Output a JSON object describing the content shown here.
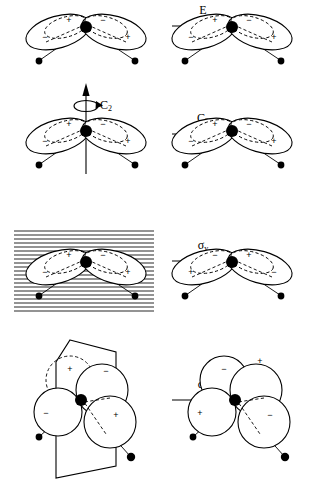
{
  "figure": {
    "ink_color": "#000000",
    "background_color": "#ffffff"
  },
  "rows": [
    {
      "id": "row-identity",
      "operation": "E",
      "operation_label": "E",
      "operation_prime": "",
      "operation_subscript": "",
      "symmetry_element": "none",
      "result": "unchanged",
      "before": {
        "view": "front",
        "lobes": [
          {
            "position": "left-upper",
            "sign": "+",
            "style": "dashed"
          },
          {
            "position": "left-lower",
            "sign": "−",
            "style": "solid"
          },
          {
            "position": "right-upper",
            "sign": "−",
            "style": "dashed"
          },
          {
            "position": "right-lower",
            "sign": "+",
            "style": "solid"
          }
        ],
        "central_atom": "filled",
        "terminal_atoms": 2
      },
      "after": {
        "view": "front",
        "lobes": [
          {
            "position": "left-upper",
            "sign": "+",
            "style": "dashed"
          },
          {
            "position": "left-lower",
            "sign": "−",
            "style": "solid"
          },
          {
            "position": "right-upper",
            "sign": "−",
            "style": "dashed"
          },
          {
            "position": "right-lower",
            "sign": "+",
            "style": "solid"
          }
        ],
        "central_atom": "filled",
        "terminal_atoms": 2
      }
    },
    {
      "id": "row-c2",
      "operation": "C2",
      "operation_label": "C",
      "operation_prime": "",
      "operation_subscript": "2",
      "symmetry_element": "vertical rotation axis with curved rotation arrow",
      "axis_label": "C",
      "axis_subscript": "2",
      "result": "unchanged",
      "before": {
        "view": "front",
        "lobes": [
          {
            "position": "left-upper",
            "sign": "+",
            "style": "dashed"
          },
          {
            "position": "left-lower",
            "sign": "−",
            "style": "solid"
          },
          {
            "position": "right-upper",
            "sign": "−",
            "style": "dashed"
          },
          {
            "position": "right-lower",
            "sign": "+",
            "style": "solid"
          }
        ],
        "central_atom": "filled",
        "terminal_atoms": 2
      },
      "after": {
        "view": "front",
        "lobes": [
          {
            "position": "left-upper",
            "sign": "+",
            "style": "dashed"
          },
          {
            "position": "left-lower",
            "sign": "−",
            "style": "solid"
          },
          {
            "position": "right-upper",
            "sign": "−",
            "style": "dashed"
          },
          {
            "position": "right-lower",
            "sign": "+",
            "style": "solid"
          }
        ],
        "central_atom": "filled",
        "terminal_atoms": 2
      }
    },
    {
      "id": "row-sigma-v",
      "operation": "sigma_v",
      "operation_label": "σ",
      "operation_prime": "",
      "operation_subscript": "v",
      "symmetry_element": "horizontal-hatched mirror plane in the molecular plane",
      "result": "signs inverted",
      "before": {
        "view": "front",
        "lobes": [
          {
            "position": "left-upper",
            "sign": "+",
            "style": "dashed"
          },
          {
            "position": "left-lower",
            "sign": "−",
            "style": "solid"
          },
          {
            "position": "right-upper",
            "sign": "−",
            "style": "dashed"
          },
          {
            "position": "right-lower",
            "sign": "+",
            "style": "solid"
          }
        ],
        "central_atom": "filled",
        "terminal_atoms": 2
      },
      "after": {
        "view": "front",
        "lobes": [
          {
            "position": "left-upper",
            "sign": "−",
            "style": "dashed"
          },
          {
            "position": "left-lower",
            "sign": "+",
            "style": "solid"
          },
          {
            "position": "right-upper",
            "sign": "+",
            "style": "dashed"
          },
          {
            "position": "right-lower",
            "sign": "−",
            "style": "solid"
          }
        ],
        "central_atom": "filled",
        "terminal_atoms": 2
      }
    },
    {
      "id": "row-sigma-v-prime",
      "operation": "sigma_v_prime",
      "operation_label": "σ",
      "operation_prime": "'",
      "operation_subscript": "v",
      "symmetry_element": "parallelogram mirror plane perpendicular to the molecular plane",
      "result": "signs inverted",
      "before": {
        "view": "perspective",
        "lobes": [
          {
            "position": "left-upper",
            "sign": "+",
            "style": "dashed"
          },
          {
            "position": "left-lower",
            "sign": "−",
            "style": "solid"
          },
          {
            "position": "right-upper",
            "sign": "−",
            "style": "dashed"
          },
          {
            "position": "right-lower",
            "sign": "+",
            "style": "solid"
          }
        ],
        "central_atom": "filled",
        "terminal_atoms": 2
      },
      "after": {
        "view": "perspective",
        "lobes": [
          {
            "position": "left-upper",
            "sign": "−",
            "style": "solid"
          },
          {
            "position": "left-lower",
            "sign": "+",
            "style": "solid"
          },
          {
            "position": "right-upper",
            "sign": "+",
            "style": "solid"
          },
          {
            "position": "right-lower",
            "sign": "−",
            "style": "solid"
          }
        ],
        "central_atom": "filled",
        "terminal_atoms": 2
      }
    }
  ]
}
